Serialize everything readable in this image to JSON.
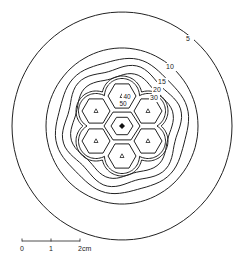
{
  "diagram": {
    "type": "isodose-contour",
    "center": [
      122,
      126
    ],
    "contour_color": "#222222",
    "contours": [
      {
        "label": "5",
        "rx": 110,
        "ry": 114,
        "label_pos": [
          188,
          41
        ]
      },
      {
        "label": "10",
        "rx": 76,
        "ry": 78,
        "label_pos": [
          170,
          69
        ]
      },
      {
        "label": "15",
        "rx": 66,
        "ry": 67,
        "label_pos": [
          162,
          84
        ]
      },
      {
        "label": "20",
        "rx": 58,
        "ry": 59,
        "label_pos": [
          157,
          92
        ]
      },
      {
        "label": "30",
        "rx": 50,
        "ry": 51,
        "label_pos": [
          154,
          100
        ]
      }
    ],
    "inner_labels": [
      {
        "label": "40",
        "pos": [
          127,
          99
        ]
      },
      {
        "label": "50",
        "pos": [
          123,
          106
        ]
      }
    ],
    "sources": {
      "marker": "triangle",
      "count": 6,
      "ring_radius": 30,
      "cell_radius": 14
    },
    "central_marker": "diamond-dot"
  },
  "scale_bar": {
    "ticks": [
      "0",
      "1",
      "2cm"
    ],
    "x_start": 22,
    "x_end": 80,
    "y": 241
  }
}
